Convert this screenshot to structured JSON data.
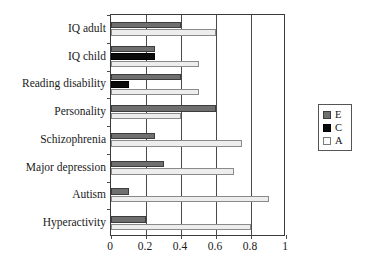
{
  "chart_data": {
    "type": "bar",
    "orientation": "horizontal",
    "title": "",
    "xlabel": "",
    "ylabel": "",
    "xlim": [
      0,
      1
    ],
    "xticks": [
      "0",
      "0.2",
      "0.4",
      "0.6",
      "0.8",
      "1"
    ],
    "xtick_values": [
      0,
      0.2,
      0.4,
      0.6,
      0.8,
      1
    ],
    "grid": true,
    "grid_axis": "x",
    "legend_position": "right",
    "categories": [
      "IQ adult",
      "IQ child",
      "Reading disability",
      "Personality",
      "Schizophrenia",
      "Major depression",
      "Autism",
      "Hyperactivity"
    ],
    "series": [
      {
        "name": "E",
        "color": "#6f6f6f",
        "values": [
          0.4,
          0.25,
          0.4,
          0.6,
          0.25,
          0.3,
          0.1,
          0.2
        ]
      },
      {
        "name": "C",
        "color": "#0a0a0a",
        "values": [
          0,
          0.25,
          0.1,
          0,
          0,
          0,
          0,
          0
        ]
      },
      {
        "name": "A",
        "color": "#ededed",
        "values": [
          0.6,
          0.5,
          0.5,
          0.4,
          0.75,
          0.7,
          0.9,
          0.8
        ]
      }
    ]
  },
  "legend": {
    "entries": [
      {
        "label": "E",
        "color": "#6f6f6f"
      },
      {
        "label": "C",
        "color": "#0a0a0a"
      },
      {
        "label": "A",
        "color": "#fbfbfb"
      }
    ]
  }
}
